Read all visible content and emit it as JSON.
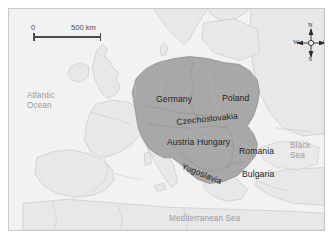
{
  "figure": {
    "name": "europe-central-powers-map",
    "frame_color": "#c9c9c9",
    "water_color": "#f2f2f2",
    "land_color": "#e8e8e8",
    "highlight_color": "#a8a8a8",
    "border_line_color": "#b8b8b8"
  },
  "scale_bar": {
    "zero_label": "0",
    "distance_label": "500 km"
  },
  "compass": {
    "north": "N",
    "east": "E",
    "south": "S",
    "west": "W"
  },
  "water_labels": [
    {
      "id": "atlantic-ocean",
      "lines": [
        "Atlantic",
        "Ocean"
      ],
      "x": 18,
      "y": 82
    },
    {
      "id": "black-sea",
      "lines": [
        "Black",
        "Sea"
      ],
      "x": 281,
      "y": 132
    },
    {
      "id": "mediterranean-sea",
      "lines": [
        "Mediterranean Sea"
      ],
      "x": 160,
      "y": 205
    }
  ],
  "country_labels": [
    {
      "id": "germany",
      "label": "Germany",
      "x": 147,
      "y": 85,
      "rotate": 0
    },
    {
      "id": "poland",
      "label": "Poland",
      "x": 213,
      "y": 84,
      "rotate": 0
    },
    {
      "id": "czechoslovakia",
      "label": "Czechoslovakia",
      "x": 167,
      "y": 108,
      "rotate": -6
    },
    {
      "id": "austria-hungary",
      "label": "Austria Hungary",
      "x": 158,
      "y": 128,
      "rotate": 0
    },
    {
      "id": "romania",
      "label": "Romania",
      "x": 230,
      "y": 137,
      "rotate": 0
    },
    {
      "id": "yugoslavia",
      "label": "Yugoslavia",
      "x": 175,
      "y": 152,
      "rotate": 22
    },
    {
      "id": "bulgaria",
      "label": "Bulgaria",
      "x": 233,
      "y": 160,
      "rotate": 0
    }
  ]
}
